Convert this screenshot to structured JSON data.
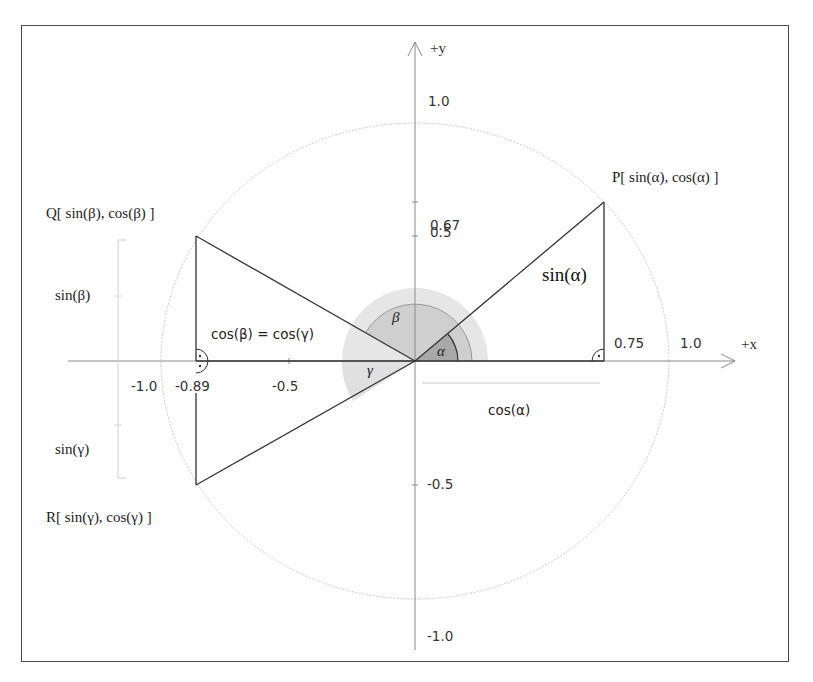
{
  "axes": {
    "x_label": "+x",
    "y_label": "+y",
    "x_ticks": [
      "-1.0",
      "-0.89",
      "-0.5",
      "0.75",
      "1.0"
    ],
    "y_ticks": [
      "1.0",
      "0.67",
      "0.5",
      "-0.5",
      "-1.0"
    ]
  },
  "points": {
    "P": "P[ sin(α), cos(α) ]",
    "Q": "Q[ sin(β), cos(β) ]",
    "R": "R[ sin(γ), cos(γ) ]"
  },
  "labels": {
    "sin_alpha": "sin(α)",
    "cos_alpha": "cos(α)",
    "sin_beta": "sin(β)",
    "sin_gamma": "sin(γ)",
    "cos_beta_eq_cos_gamma": "cos(β) = cos(γ)"
  },
  "angles": {
    "alpha": "α",
    "beta": "β",
    "gamma": "γ"
  },
  "colors": {
    "alpha_fill": "#a9a9a9",
    "beta_fill": "#cfcfcf",
    "outer_fill": "#e4e4e4",
    "gamma_fill": "#e0e0e0",
    "circle": "#c8c8c8",
    "line": "#333333"
  }
}
